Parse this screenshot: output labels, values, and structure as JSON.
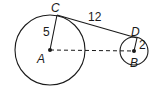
{
  "diagram": {
    "type": "two circles with common external tangent",
    "points": {
      "A": {
        "label": "A",
        "x": 50,
        "y": 50
      },
      "B": {
        "label": "B",
        "x": 134,
        "y": 51
      },
      "C": {
        "label": "C",
        "x": 57,
        "y": 15
      },
      "D": {
        "label": "D",
        "x": 137,
        "y": 38
      }
    },
    "circles": [
      {
        "center": "A",
        "radius_px": 35,
        "radius_label": "5"
      },
      {
        "center": "B",
        "radius_px": 14,
        "radius_label": "2"
      }
    ],
    "segments": [
      {
        "from": "A",
        "to": "C",
        "style": "solid",
        "label": "5"
      },
      {
        "from": "B",
        "to": "D",
        "style": "solid",
        "label": "2"
      },
      {
        "from": "C",
        "to": "D",
        "style": "solid",
        "label": "12"
      },
      {
        "from": "A",
        "to": "B",
        "style": "dashed",
        "label": ""
      }
    ],
    "labels": {
      "A": "A",
      "B": "B",
      "C": "C",
      "D": "D",
      "ac_length": "5",
      "bd_length": "2",
      "cd_length": "12"
    },
    "colors": {
      "stroke": "#1a1a1a",
      "background": "#ffffff"
    }
  }
}
